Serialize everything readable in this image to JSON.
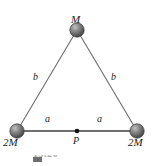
{
  "figure": {
    "background_color": "#ffffff",
    "line_color": "#6e6e6e",
    "sphere_color_dark": "#4a4a4a",
    "sphere_color_mid": "#7d7d7d",
    "sphere_color_light": "#b9b9b9",
    "label_color": "#1b1b1b",
    "masses": [
      {
        "id": "apex",
        "label": "M",
        "x": 77,
        "y": 30,
        "radius": 7
      },
      {
        "id": "bottom-left",
        "label": "2M",
        "x": 17,
        "y": 131,
        "radius": 7
      },
      {
        "id": "bottom-right",
        "label": "2M",
        "x": 137,
        "y": 131,
        "radius": 7
      }
    ],
    "point": {
      "id": "P",
      "label": "P",
      "x": 77,
      "y": 131,
      "radius": 2
    },
    "segments": [
      {
        "id": "left-side",
        "label": "b",
        "from": "bottom-left",
        "to": "apex"
      },
      {
        "id": "right-side",
        "label": "b",
        "from": "apex",
        "to": "bottom-right"
      },
      {
        "id": "base-left",
        "label": "a",
        "from": "bottom-left",
        "to": "P"
      },
      {
        "id": "base-right",
        "label": "a",
        "from": "P",
        "to": "bottom-right"
      }
    ],
    "labels": {
      "apex_mass": "M",
      "left_mass": "2M",
      "right_mass": "2M",
      "side_left": "b",
      "side_right": "b",
      "base_left": "a",
      "base_right": "a",
      "point_p": "P"
    },
    "caption": {
      "visible_fragment": "13.26",
      "note": "cut off"
    }
  }
}
